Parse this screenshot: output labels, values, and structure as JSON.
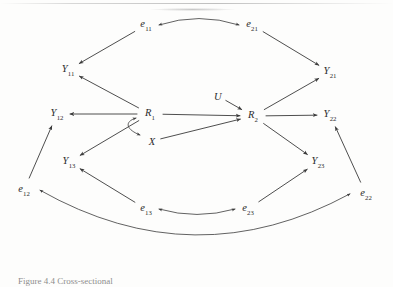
{
  "figure": {
    "type": "path-diagram",
    "caption": "Figure 4.4  Cross-sectional",
    "stroke_color": "#3a3a3a",
    "label_color": "#2b2b2b",
    "background": "#fdfdfc"
  },
  "nodes": [
    {
      "id": "e11",
      "base": "e",
      "sub": "11",
      "x": 146,
      "y": 25
    },
    {
      "id": "e21",
      "base": "e",
      "sub": "21",
      "x": 252,
      "y": 25
    },
    {
      "id": "Y11",
      "base": "Y",
      "sub": "11",
      "x": 68,
      "y": 70
    },
    {
      "id": "Y21",
      "base": "Y",
      "sub": "21",
      "x": 330,
      "y": 72
    },
    {
      "id": "Y12",
      "base": "Y",
      "sub": "12",
      "x": 57,
      "y": 114
    },
    {
      "id": "Y22",
      "base": "Y",
      "sub": "22",
      "x": 330,
      "y": 115
    },
    {
      "id": "R1",
      "base": "R",
      "sub": "1",
      "x": 150,
      "y": 114
    },
    {
      "id": "R2",
      "base": "R",
      "sub": "2",
      "x": 253,
      "y": 116
    },
    {
      "id": "U",
      "base": "U",
      "sub": "",
      "x": 218,
      "y": 96
    },
    {
      "id": "X",
      "base": "X",
      "sub": "",
      "x": 152,
      "y": 141
    },
    {
      "id": "Y13",
      "base": "Y",
      "sub": "13",
      "x": 69,
      "y": 162
    },
    {
      "id": "Y23",
      "base": "Y",
      "sub": "23",
      "x": 318,
      "y": 162
    },
    {
      "id": "e12",
      "base": "e",
      "sub": "12",
      "x": 24,
      "y": 190
    },
    {
      "id": "e22",
      "base": "e",
      "sub": "22",
      "x": 366,
      "y": 194
    },
    {
      "id": "e13",
      "base": "e",
      "sub": "13",
      "x": 146,
      "y": 209
    },
    {
      "id": "e23",
      "base": "e",
      "sub": "23",
      "x": 248,
      "y": 209
    }
  ],
  "edges": [
    {
      "id": "e11-to-Y11",
      "from": "e11",
      "to": "Y11",
      "kind": "directed"
    },
    {
      "id": "e21-to-Y21",
      "from": "e21",
      "to": "Y21",
      "kind": "directed"
    },
    {
      "id": "R1-to-Y11",
      "from": "R1",
      "to": "Y11",
      "kind": "directed"
    },
    {
      "id": "R1-to-Y12",
      "from": "R1",
      "to": "Y12",
      "kind": "directed"
    },
    {
      "id": "R1-to-Y13",
      "from": "R1",
      "to": "Y13",
      "kind": "directed"
    },
    {
      "id": "R1-to-R2",
      "from": "R1",
      "to": "R2",
      "kind": "directed"
    },
    {
      "id": "X-to-R2",
      "from": "X",
      "to": "R2",
      "kind": "directed"
    },
    {
      "id": "U-to-R2",
      "from": "U",
      "to": "R2",
      "kind": "directed"
    },
    {
      "id": "R2-to-Y21",
      "from": "R2",
      "to": "Y21",
      "kind": "directed"
    },
    {
      "id": "R2-to-Y22",
      "from": "R2",
      "to": "Y22",
      "kind": "directed"
    },
    {
      "id": "R2-to-Y23",
      "from": "R2",
      "to": "Y23",
      "kind": "directed"
    },
    {
      "id": "e12-to-Y12",
      "from": "e12",
      "to": "Y12",
      "kind": "directed"
    },
    {
      "id": "e22-to-Y22",
      "from": "e22",
      "to": "Y22",
      "kind": "directed"
    },
    {
      "id": "e13-to-Y13",
      "from": "e13",
      "to": "Y13",
      "kind": "directed"
    },
    {
      "id": "e23-to-Y23",
      "from": "e23",
      "to": "Y23",
      "kind": "directed"
    },
    {
      "id": "e11-e21-corr",
      "from": "e11",
      "to": "e21",
      "kind": "bidirectional-curve"
    },
    {
      "id": "e13-e23-corr",
      "from": "e13",
      "to": "e23",
      "kind": "bidirectional-curve"
    },
    {
      "id": "e12-e22-corr",
      "from": "e12",
      "to": "e22",
      "kind": "bidirectional-curve"
    },
    {
      "id": "R1-X-corr",
      "from": "R1",
      "to": "X",
      "kind": "bidirectional-curve"
    }
  ]
}
